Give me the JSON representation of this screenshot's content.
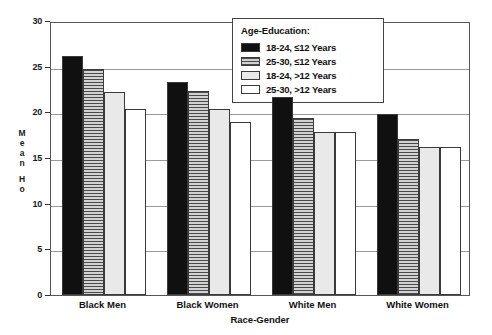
{
  "chart_data": {
    "type": "bar",
    "title": "",
    "xlabel": "Race-Gender",
    "ylabel": "Mean Ho",
    "ylim": [
      0,
      30
    ],
    "yticks": [
      0,
      5,
      10,
      15,
      20,
      25,
      30
    ],
    "grid": true,
    "legend_position": "top-right",
    "legend_title": "Age-Education:",
    "categories": [
      "Black Men",
      "Black Women",
      "White Men",
      "White Women"
    ],
    "series": [
      {
        "name": "18-24, ≤12 Years",
        "values": [
          26.2,
          23.3,
          21.7,
          19.8
        ],
        "fill": "solid-black"
      },
      {
        "name": "25-30, ≤12 Years",
        "values": [
          24.7,
          22.3,
          19.4,
          17.1
        ],
        "fill": "hatch-gray"
      },
      {
        "name": "18-24, >12 Years",
        "values": [
          22.2,
          20.4,
          17.8,
          16.2
        ],
        "fill": "light-gray"
      },
      {
        "name": "25-30, >12 Years",
        "values": [
          20.4,
          18.9,
          17.9,
          16.2
        ],
        "fill": "white"
      }
    ]
  },
  "axis": {
    "y_title_chars": [
      "M",
      "e",
      "a",
      "n",
      "H",
      "o"
    ],
    "y_tick_labels": [
      "30",
      "25",
      "20",
      "15",
      "10",
      "5",
      "0"
    ],
    "x_title": "Race-Gender"
  },
  "legend": {
    "title": "Age-Education:",
    "items": [
      {
        "label": "18-24, ≤12 Years",
        "fill": "solid-black"
      },
      {
        "label": "25-30, ≤12 Years",
        "fill": "hatch-gray"
      },
      {
        "label": "18-24, >12 Years",
        "fill": "light-gray"
      },
      {
        "label": "25-30, >12 Years",
        "fill": "white"
      }
    ]
  },
  "colors": {
    "series_1": "#101010",
    "series_2": "#a8a8a8",
    "series_3": "#e9e9e9",
    "series_4": "#ffffff",
    "axis": "#333333",
    "grid": "#9a9a9a"
  }
}
